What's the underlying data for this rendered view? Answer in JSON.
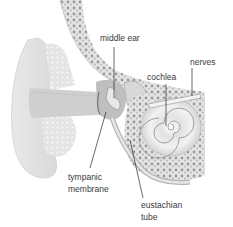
{
  "diagram": {
    "labels": {
      "middle_ear": "middle ear",
      "nerves": "nerves",
      "cochlea": "cochlea",
      "tympanic_membrane_line1": "tympanic",
      "tympanic_membrane_line2": "membrane",
      "eustachian_tube_line1": "eustachian",
      "eustachian_tube_line2": "tube"
    },
    "colors": {
      "background": "#ffffff",
      "tissue_light": "#ececec",
      "tissue_mid": "#d6d6d6",
      "tissue_dark": "#a8a8a8",
      "bone_pattern": "#8a8a8a",
      "canal": "#c8c8c8",
      "leader_line": "#2a2a2a",
      "label_text": "#3a3a3a"
    }
  }
}
